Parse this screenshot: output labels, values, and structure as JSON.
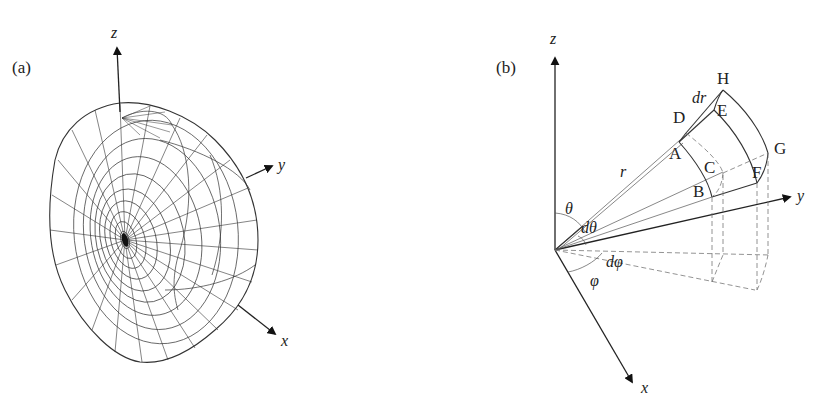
{
  "figure": {
    "panel_a": {
      "label": "(a)",
      "description": "Wireframe 3D surface (radiation-pattern-like lobe) with axes",
      "axes": {
        "z": "z",
        "y": "y",
        "x": "x"
      }
    },
    "panel_b": {
      "label": "(b)",
      "description": "Spherical coordinate volume element",
      "axes": {
        "z": "z",
        "y": "y",
        "x": "x"
      },
      "vertices": [
        "A",
        "B",
        "C",
        "D",
        "E",
        "F",
        "G",
        "H"
      ],
      "symbols": {
        "r": "r",
        "dr": "dr",
        "theta": "θ",
        "dtheta": "dθ",
        "phi": "φ",
        "dphi": "dφ"
      }
    }
  },
  "colors": {
    "stroke": "#333333",
    "dashed": "#777777",
    "background": "#ffffff"
  }
}
